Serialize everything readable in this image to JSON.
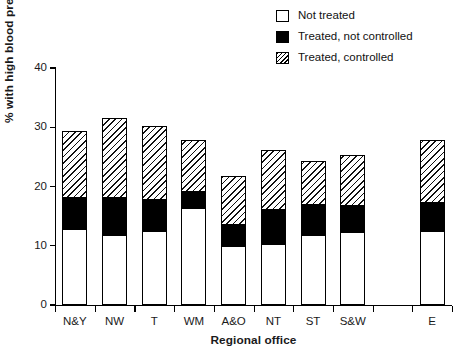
{
  "chart_data": {
    "type": "bar",
    "subtype": "stacked-bar",
    "title": "",
    "xlabel": "Regional office",
    "ylabel": "% with high blood pressure",
    "ylim": [
      0,
      40
    ],
    "yticks": [
      0,
      10,
      20,
      30,
      40
    ],
    "ytick_labels": [
      "0",
      "10",
      "20",
      "30",
      "40"
    ],
    "grid": false,
    "legend_position": "top-right",
    "categories": [
      "N&Y",
      "NW",
      "T",
      "WM",
      "A&O",
      "NT",
      "ST",
      "S&W",
      "",
      "E"
    ],
    "series": [
      {
        "name": "Not treated",
        "fill": "white",
        "values": [
          12.8,
          11.9,
          12.5,
          16.3,
          10.0,
          10.3,
          11.8,
          12.3,
          null,
          12.5
        ]
      },
      {
        "name": "Treated, not controlled",
        "fill": "black",
        "values": [
          5.3,
          6.2,
          5.3,
          2.8,
          3.5,
          5.8,
          5.0,
          4.4,
          null,
          4.7
        ]
      },
      {
        "name": "Treated, controlled",
        "fill": "hatched",
        "values": [
          11.2,
          13.5,
          12.4,
          8.8,
          8.3,
          10.0,
          7.5,
          8.6,
          null,
          10.7
        ]
      }
    ],
    "totals": [
      29.3,
      31.6,
      30.2,
      27.9,
      21.8,
      26.1,
      24.3,
      25.3,
      null,
      27.9
    ]
  },
  "legend": {
    "items": [
      {
        "label": "Not treated",
        "swatch": "open-square-swatch"
      },
      {
        "label": "Treated, not controlled",
        "swatch": "filled-square-swatch"
      },
      {
        "label": "Treated, controlled",
        "swatch": "hatched-square-swatch"
      }
    ]
  },
  "axes": {
    "y_title": "% with high blood pressure",
    "x_title": "Regional office",
    "y_tick_labels": [
      "40",
      "30",
      "20",
      "10",
      "0"
    ],
    "x_tick_labels": [
      "N&Y",
      "NW",
      "T",
      "WM",
      "A&O",
      "NT",
      "ST",
      "S&W",
      "E"
    ]
  },
  "colors": {
    "axis": "#000000",
    "not_treated": "#ffffff",
    "treated_not_controlled": "#000000",
    "treated_controlled": "#ffffff",
    "hatch_stroke": "#111111",
    "background": "#ffffff"
  }
}
